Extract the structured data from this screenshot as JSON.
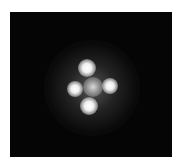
{
  "image": {
    "subject": "quadruply lensed quasar (Einstein cross)",
    "background_color": "#050505",
    "frame": {
      "x": 10,
      "y": 12,
      "width": 162,
      "height": 145
    },
    "halo": {
      "cx": 92,
      "cy": 88,
      "r": 48
    },
    "spots": [
      {
        "name": "top",
        "cx": 87,
        "cy": 68,
        "r": 7
      },
      {
        "name": "left",
        "cx": 75,
        "cy": 89,
        "r": 6
      },
      {
        "name": "center",
        "cx": 93,
        "cy": 87,
        "r": 8
      },
      {
        "name": "right",
        "cx": 110,
        "cy": 86,
        "r": 6
      },
      {
        "name": "bottom",
        "cx": 89,
        "cy": 106,
        "r": 7
      }
    ]
  }
}
